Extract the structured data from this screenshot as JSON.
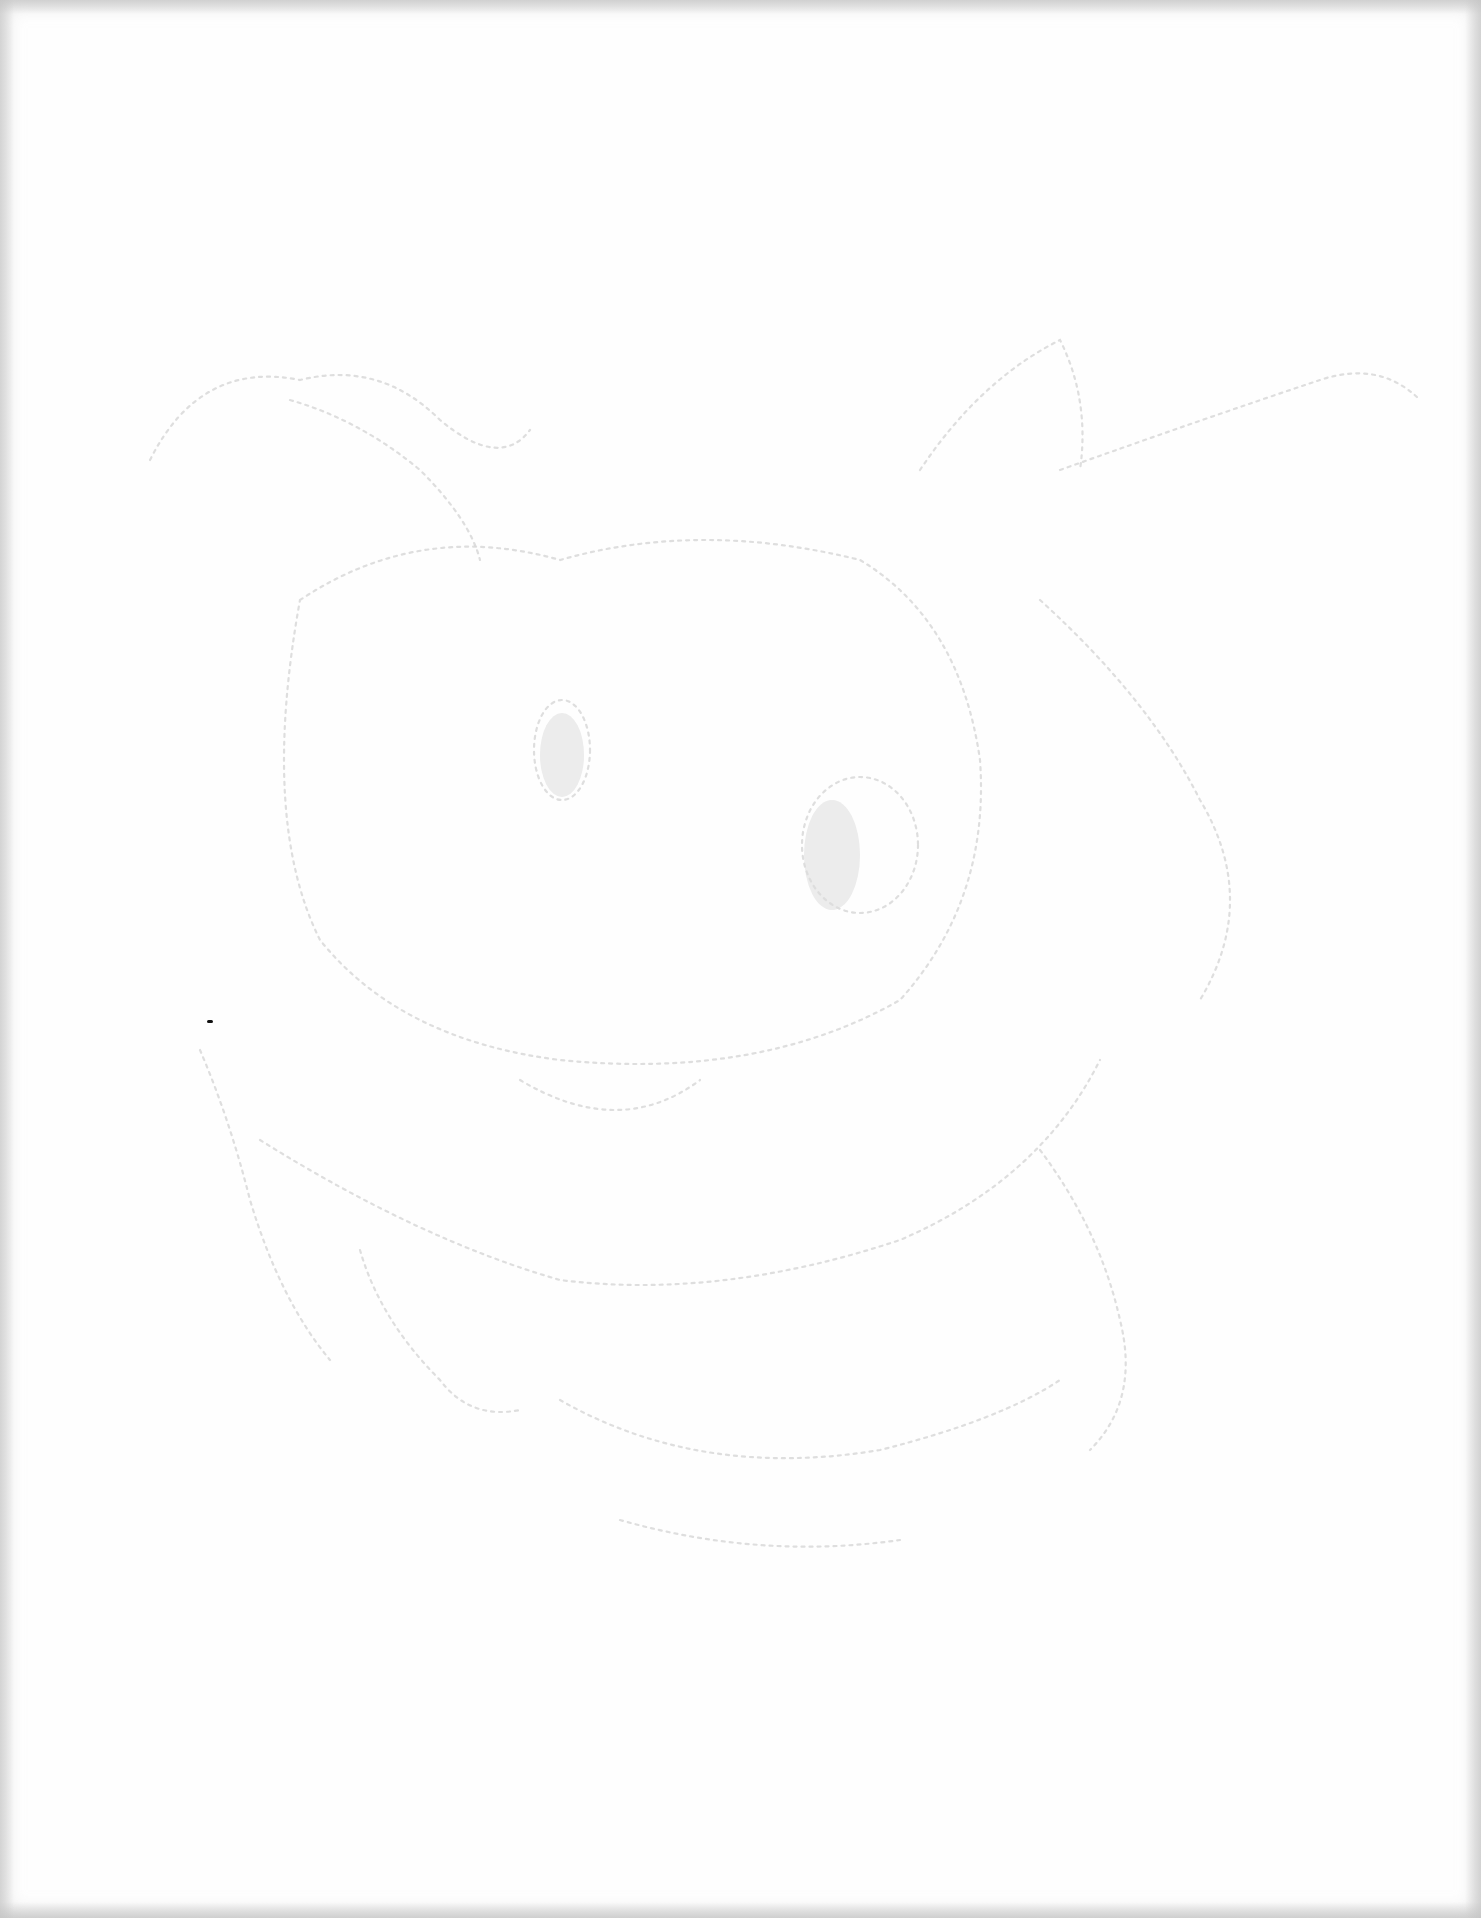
{
  "page": {
    "type": "scanned-paper",
    "background_color": "#fefefe",
    "edge_shadow_color": "#c8c8c8",
    "sketch_stroke_color": "#d6d6d6",
    "speck_color": "#111111"
  },
  "sketch": {
    "elements": [
      "left-ear-shape",
      "right-ear-shape",
      "left-eye",
      "right-eye",
      "face-outline",
      "mouth-curve",
      "body-outline"
    ]
  }
}
